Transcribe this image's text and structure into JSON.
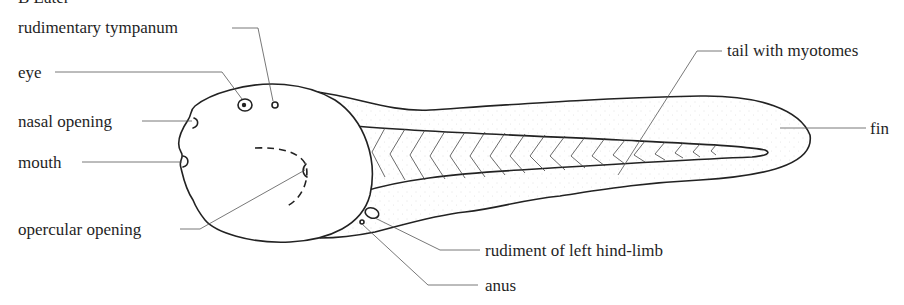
{
  "figure": {
    "heading_partial": "B Later"
  },
  "labels": {
    "rudimentary_tympanum": "rudimentary tympanum",
    "eye": "eye",
    "nasal_opening": "nasal opening",
    "mouth": "mouth",
    "opercular_opening": "opercular opening",
    "tail_with_myotomes": "tail with myotomes",
    "fin": "fin",
    "rudiment_hind_limb": "rudiment of left hind-limb",
    "anus": "anus"
  },
  "colors": {
    "ink": "#222222",
    "leader": "#555555",
    "fin_stipple": "#bdbdbd",
    "background": "#ffffff"
  }
}
